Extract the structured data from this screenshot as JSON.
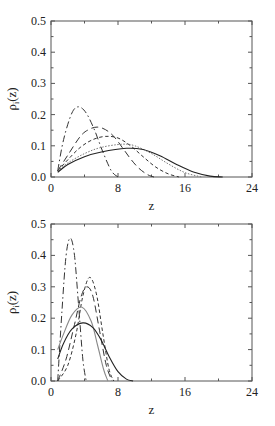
{
  "chart_data": [
    {
      "type": "line",
      "panel": "top",
      "title": "",
      "xlabel": "z",
      "ylabel": "ρ_i(z)",
      "xlim": [
        0,
        24
      ],
      "ylim": [
        0,
        0.5
      ],
      "xticks": [
        0,
        8,
        16,
        24
      ],
      "yticks": [
        0.0,
        0.1,
        0.2,
        0.3,
        0.4,
        0.5
      ],
      "xtick_labels": [
        "0",
        "8",
        "16",
        "24"
      ],
      "ytick_labels": [
        "0.0",
        "0.1",
        "0.2",
        "0.3",
        "0.4",
        "0.5"
      ],
      "grid": false,
      "legend": null,
      "series": [
        {
          "name": "dash-dot",
          "style": "dashdot",
          "color": "#333333",
          "x": [
            0.8,
            1.5,
            2.5,
            3.3,
            4.2,
            5.2,
            6.2,
            7.2,
            8.0
          ],
          "y": [
            0.02,
            0.12,
            0.205,
            0.225,
            0.205,
            0.15,
            0.08,
            0.02,
            0.0
          ]
        },
        {
          "name": "long-dash",
          "style": "longdash",
          "color": "#333333",
          "x": [
            0.8,
            2,
            3.5,
            4.5,
            5.5,
            6.5,
            7.5,
            8.5,
            9.5,
            10.5,
            11.5,
            12.3
          ],
          "y": [
            0.02,
            0.07,
            0.13,
            0.152,
            0.16,
            0.152,
            0.13,
            0.095,
            0.058,
            0.028,
            0.008,
            0.0
          ]
        },
        {
          "name": "short-dash",
          "style": "shortdash",
          "color": "#333333",
          "x": [
            0.8,
            2,
            3.5,
            5,
            6.5,
            8,
            9.5,
            11,
            12.5,
            14,
            15.3
          ],
          "y": [
            0.02,
            0.055,
            0.095,
            0.12,
            0.13,
            0.125,
            0.1,
            0.065,
            0.032,
            0.01,
            0.0
          ]
        },
        {
          "name": "dotted-gray",
          "style": "dotted",
          "color": "#777777",
          "x": [
            0.8,
            2,
            4,
            6,
            8.5,
            10,
            12,
            14,
            16,
            18
          ],
          "y": [
            0.02,
            0.045,
            0.075,
            0.095,
            0.105,
            0.1,
            0.075,
            0.042,
            0.014,
            0.0
          ]
        },
        {
          "name": "solid",
          "style": "solid",
          "color": "#222222",
          "x": [
            0.8,
            2,
            4,
            6,
            9,
            11,
            13,
            15,
            17,
            19,
            20.5
          ],
          "y": [
            0.015,
            0.04,
            0.065,
            0.08,
            0.092,
            0.088,
            0.068,
            0.04,
            0.016,
            0.003,
            0.0
          ]
        }
      ]
    },
    {
      "type": "line",
      "panel": "bottom",
      "title": "",
      "xlabel": "z",
      "ylabel": "ρ_i(z)",
      "xlim": [
        0,
        24
      ],
      "ylim": [
        0,
        0.5
      ],
      "xticks": [
        0,
        8,
        16,
        24
      ],
      "yticks": [
        0.0,
        0.1,
        0.2,
        0.3,
        0.4,
        0.5
      ],
      "xtick_labels": [
        "0",
        "8",
        "16",
        "24"
      ],
      "ytick_labels": [
        "0.0",
        "0.1",
        "0.2",
        "0.3",
        "0.4",
        "0.5"
      ],
      "grid": false,
      "legend": null,
      "series": [
        {
          "name": "dash-dot",
          "style": "dashdot",
          "color": "#333333",
          "x": [
            0.8,
            1.3,
            1.8,
            2.3,
            2.8,
            3.3,
            3.8,
            4.2
          ],
          "y": [
            0.0,
            0.22,
            0.4,
            0.455,
            0.4,
            0.24,
            0.07,
            0.0
          ]
        },
        {
          "name": "short-dash",
          "style": "shortdash",
          "color": "#333333",
          "x": [
            0.8,
            2,
            3,
            3.8,
            4.6,
            5.4,
            6.2,
            6.9,
            7.5
          ],
          "y": [
            0.0,
            0.05,
            0.15,
            0.27,
            0.33,
            0.28,
            0.15,
            0.04,
            0.0
          ]
        },
        {
          "name": "long-dash",
          "style": "longdash",
          "color": "#333333",
          "x": [
            0.8,
            1.8,
            2.8,
            3.6,
            4.3,
            5.0,
            5.8,
            6.6,
            7.3
          ],
          "y": [
            0.0,
            0.07,
            0.18,
            0.27,
            0.3,
            0.27,
            0.16,
            0.05,
            0.0
          ]
        },
        {
          "name": "solid-gray",
          "style": "solid",
          "color": "#888888",
          "x": [
            0.8,
            1.5,
            2.5,
            3.7,
            4.8,
            5.6,
            6.3,
            6.8
          ],
          "y": [
            0.1,
            0.15,
            0.21,
            0.235,
            0.19,
            0.11,
            0.035,
            0.0
          ]
        },
        {
          "name": "solid",
          "style": "solid",
          "color": "#222222",
          "x": [
            0.8,
            1.5,
            2.5,
            3.8,
            5,
            6,
            7,
            8,
            9,
            9.8
          ],
          "y": [
            0.07,
            0.12,
            0.165,
            0.185,
            0.17,
            0.13,
            0.075,
            0.03,
            0.006,
            0.0
          ]
        }
      ]
    }
  ],
  "labels": {
    "top": {
      "xlabel": "z",
      "ylabel_main": "ρ",
      "ylabel_sub": "i",
      "ylabel_arg": "(z)"
    },
    "bottom": {
      "xlabel": "z",
      "ylabel_main": "ρ",
      "ylabel_sub": "i",
      "ylabel_arg": "(z)"
    }
  }
}
